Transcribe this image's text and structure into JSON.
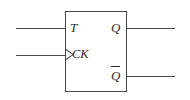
{
  "diagram": {
    "background_color": "#ffffff",
    "line_color": "#4a4a4a",
    "text_color": "#2b2b2b",
    "body": {
      "shape": "rectangle",
      "x": 65,
      "y": 11,
      "width": 62,
      "height": 81
    },
    "inputs": [
      {
        "id": "t",
        "label": "T",
        "side": "left",
        "wire": {
          "x": 16,
          "y": 28,
          "length": 49
        },
        "edge_triggered": false
      },
      {
        "id": "ck",
        "label": "CK",
        "side": "left",
        "wire": {
          "x": 16,
          "y": 55,
          "length": 49
        },
        "edge_triggered": true,
        "marker": "dynamic-input-triangle"
      }
    ],
    "outputs": [
      {
        "id": "q",
        "label": "Q",
        "side": "right",
        "inverted": false,
        "wire": {
          "x": 127,
          "y": 28,
          "length": 48
        }
      },
      {
        "id": "q_bar",
        "label": "Q",
        "side": "right",
        "inverted": true,
        "overline": true,
        "wire": {
          "x": 127,
          "y": 76,
          "length": 48
        }
      }
    ]
  }
}
